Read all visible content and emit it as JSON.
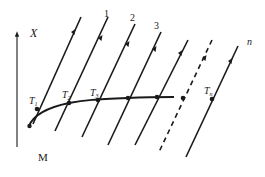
{
  "diagram": {
    "axis": {
      "label": "X"
    },
    "bottom_label": "M",
    "line_labels": {
      "line1": "1",
      "line2": "2",
      "line3": "3",
      "line_n": "n"
    },
    "point_labels": {
      "t1": "T",
      "t1_sub": "1",
      "t2": "T",
      "t2_sub": "2",
      "t3": "T",
      "t3_sub": "3",
      "tn": "T",
      "tn_sub": "n"
    },
    "colors": {
      "stroke": "#1a1a1a",
      "background": "#ffffff"
    }
  }
}
